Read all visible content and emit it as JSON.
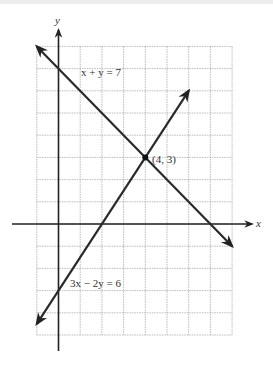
{
  "chart_data": {
    "type": "line",
    "title": "",
    "xlabel": "x",
    "ylabel": "y",
    "xlim": [
      -1,
      8
    ],
    "ylim": [
      -5,
      8
    ],
    "grid": true,
    "grid_step": 1,
    "series": [
      {
        "name": "x + y = 7",
        "equation": "x + y = 7",
        "x": [
          -1,
          8
        ],
        "y": [
          8,
          -1
        ],
        "label_at": [
          1,
          7
        ]
      },
      {
        "name": "3x − 2y = 6",
        "equation": "3x − 2y = 6",
        "x": [
          -1,
          6
        ],
        "y": [
          -4.5,
          6
        ],
        "label_at": [
          0,
          -4
        ]
      }
    ],
    "points": [
      {
        "x": 4,
        "y": 3,
        "label": "(4, 3)"
      }
    ],
    "annotations": [
      "x + y = 7",
      "3x − 2y = 6",
      "(4, 3)"
    ]
  },
  "labels": {
    "x_axis": "x",
    "y_axis": "y",
    "line1": "x + y = 7",
    "line2": "3x − 2y = 6",
    "intersection": "(4, 3)"
  },
  "colors": {
    "grid": "#a8a8a8",
    "axis": "#222222",
    "line": "#2a2a2a"
  }
}
